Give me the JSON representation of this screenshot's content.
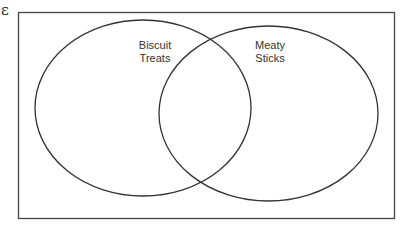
{
  "diagram": {
    "type": "venn",
    "universe_symbol": "ε",
    "sets": [
      {
        "name": "Biscuit Treats",
        "label_line1": "Biscuit",
        "label_line2": "Treats"
      },
      {
        "name": "Meaty Sticks",
        "label_line1": "Meaty",
        "label_line2": "Sticks"
      }
    ],
    "colors": {
      "stroke": "#333333",
      "background": "#ffffff"
    }
  }
}
